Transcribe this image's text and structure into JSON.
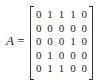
{
  "equation": {
    "variable": "A",
    "equals": "=",
    "matrix": [
      [
        "0",
        "1",
        "1",
        "1",
        "0"
      ],
      [
        "0",
        "0",
        "0",
        "0",
        "0"
      ],
      [
        "0",
        "0",
        "0",
        "1",
        "0"
      ],
      [
        "0",
        "1",
        "0",
        "0",
        "0"
      ],
      [
        "0",
        "1",
        "1",
        "0",
        "0"
      ]
    ]
  }
}
